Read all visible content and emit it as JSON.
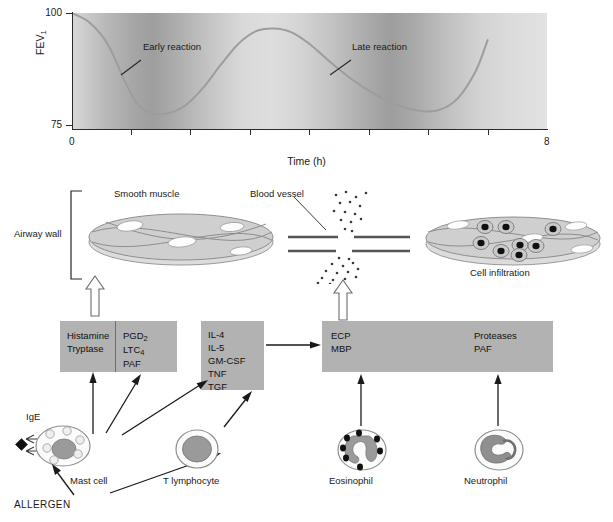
{
  "chart_data": {
    "type": "line",
    "title": "",
    "xlabel": "Time (h)",
    "ylabel": "FEV1",
    "ylabel_text": "FEV",
    "ylabel_sub": "1",
    "xlim": [
      0,
      8
    ],
    "ylim": [
      70,
      100
    ],
    "ytick_labels": [
      "100",
      "75"
    ],
    "ytick_values": [
      100,
      75
    ],
    "xtick_labels": [
      "0",
      "8"
    ],
    "xtick_values": [
      0,
      8
    ],
    "minor_xticks": [
      1,
      2,
      3,
      4,
      5,
      6,
      7
    ],
    "grid": false,
    "legend": "none",
    "series": [
      {
        "name": "FEV1",
        "x": [
          0.0,
          0.3,
          0.6,
          0.9,
          1.1,
          1.3,
          1.6,
          1.9,
          2.2,
          2.5,
          2.8,
          3.1,
          3.4,
          3.7,
          4.0,
          4.3,
          4.7,
          5.1,
          5.5,
          5.9,
          6.2,
          6.5,
          6.8,
          7.0
        ],
        "y": [
          100.0,
          97.5,
          92.0,
          82.0,
          76.5,
          74.3,
          74.0,
          76.0,
          80.5,
          86.5,
          92.0,
          95.3,
          96.0,
          95.0,
          92.0,
          88.0,
          83.0,
          79.0,
          76.0,
          74.6,
          75.0,
          78.0,
          85.0,
          93.0
        ]
      }
    ],
    "annotations": [
      {
        "label": "Early reaction",
        "points_to_x": 0.85,
        "points_to_y": 87.0
      },
      {
        "label": "Late reaction",
        "points_to_x": 4.45,
        "points_to_y": 87.0
      }
    ]
  },
  "diagram": {
    "airway_wall_label": "Airway wall",
    "smooth_muscle_label": "Smooth muscle",
    "blood_vessel_label": "Blood vessel",
    "cell_infiltration_label": "Cell infiltration",
    "mediator_box": {
      "left_column": [
        "Histamine",
        "Tryptase"
      ],
      "right_column_lines": [
        {
          "text": "PGD",
          "sub": "2"
        },
        {
          "text": "LTC",
          "sub": "4"
        },
        {
          "text": "PAF",
          "sub": ""
        }
      ]
    },
    "cytokine_box": {
      "items": [
        "IL-4",
        "IL-5",
        "GM-CSF",
        "TNF",
        "TGF"
      ]
    },
    "effector_box": {
      "left_column": [
        "ECP",
        "MBP"
      ],
      "right_column": [
        "Proteases",
        "PAF"
      ]
    },
    "cells": [
      {
        "name": "mast-cell",
        "label": "Mast cell"
      },
      {
        "name": "t-lymphocyte",
        "label": "T lymphocyte"
      },
      {
        "name": "eosinophil",
        "label": "Eosinophil"
      },
      {
        "name": "neutrophil",
        "label": "Neutrophil"
      }
    ],
    "ige_label": "IgE",
    "allergen_label": "ALLERGEN"
  },
  "colors": {
    "box_fill": "#b2b2b2",
    "curve": "#9a9a9a",
    "ink": "#1a1a1a",
    "cell_fill": "#9a9a9a",
    "muscle_fill": "#cfcfcf"
  }
}
